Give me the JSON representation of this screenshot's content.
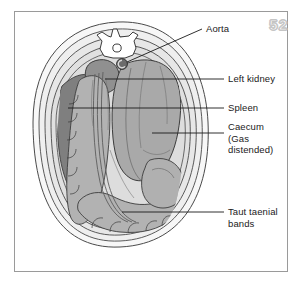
{
  "figure": {
    "page_number": "52",
    "labels": [
      {
        "id": "aorta",
        "text": "Aorta",
        "x": 206,
        "y": 28
      },
      {
        "id": "left-kidney",
        "text": "Left kidney",
        "x": 228,
        "y": 75
      },
      {
        "id": "spleen",
        "text": "Spleen",
        "x": 228,
        "y": 104
      },
      {
        "id": "caecum",
        "text": "Caecum\n(Gas\ndistended)",
        "x": 228,
        "y": 120
      },
      {
        "id": "taut-taenial-bands",
        "text": "Taut taenial\nbands",
        "x": 228,
        "y": 205
      }
    ],
    "structures": [
      {
        "id": "body-wall-outer",
        "name": "outer body wall",
        "color": "#f4f4f4"
      },
      {
        "id": "body-wall-fat",
        "name": "subcutaneous fat layer",
        "color": "#eaeaea"
      },
      {
        "id": "body-wall-muscle",
        "name": "muscle layer",
        "color": "#e2e2e2"
      },
      {
        "id": "peritoneal-cavity",
        "name": "peritoneal cavity",
        "color": "#dcdcdc"
      },
      {
        "id": "vertebra",
        "name": "lumbar vertebra",
        "color": "#ffffff"
      },
      {
        "id": "spinal-canal",
        "name": "spinal canal",
        "color": "#ffffff"
      },
      {
        "id": "aorta",
        "name": "aorta",
        "color": "#6e6e6e"
      },
      {
        "id": "left-kidney",
        "name": "left kidney",
        "color": "#8e8e8e"
      },
      {
        "id": "spleen",
        "name": "spleen",
        "color": "#7c7c7c"
      },
      {
        "id": "caecum",
        "name": "gas distended caecum",
        "color": "#a9a9a9"
      },
      {
        "id": "bowel-loops",
        "name": "bowel loops",
        "color": "#b0b0b0"
      },
      {
        "id": "taenial-bands",
        "name": "taut taenial bands",
        "color": "#6a6a6a"
      }
    ],
    "colors": {
      "frame_border": "#9a9a9a",
      "outline": "#3c3c3c",
      "leader_line": "#1a1a1a",
      "background": "#ffffff",
      "page_number_stroke": "#c4c4c4"
    }
  }
}
